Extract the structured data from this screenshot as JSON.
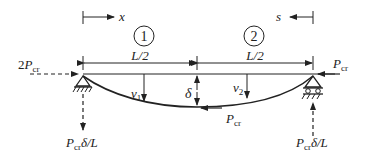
{
  "diagram": {
    "axis_x_label": "x",
    "axis_s_label": "s",
    "segment_1": {
      "number": "1",
      "length_label": "L/2"
    },
    "segment_2": {
      "number": "2",
      "length_label": "L/2"
    },
    "left_load": {
      "coef": "2",
      "symbol": "P",
      "sub": "cr"
    },
    "right_load": {
      "symbol": "P",
      "sub": "cr"
    },
    "mid_load": {
      "symbol": "P",
      "sub": "cr"
    },
    "deflection_1": {
      "symbol": "v",
      "sub": "1"
    },
    "deflection_2": {
      "symbol": "v",
      "sub": "2"
    },
    "mid_deflection": "δ",
    "left_reaction": {
      "symbol": "P",
      "sub": "cr",
      "rest": "δ/L"
    },
    "right_reaction": {
      "symbol": "P",
      "sub": "cr",
      "rest": "δ/L"
    },
    "colors": {
      "line": "#222222",
      "background": "#ffffff"
    }
  }
}
